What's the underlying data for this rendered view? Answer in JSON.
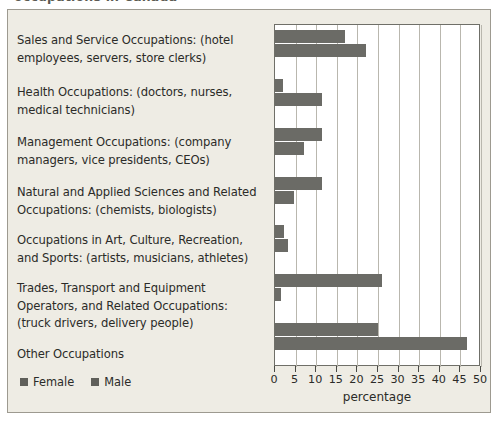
{
  "top_sliver": {
    "text": "occupations in Canada"
  },
  "legend": {
    "position": "bottom-left",
    "entries": [
      {
        "label": "Female",
        "color": "#5f5f5a"
      },
      {
        "label": "Male",
        "color": "#5f5f5a"
      }
    ]
  },
  "axis": {
    "title": "percentage",
    "ticks": [
      "0",
      "5",
      "10",
      "15",
      "20",
      "25",
      "30",
      "35",
      "40",
      "45",
      "50"
    ]
  },
  "chart_data": {
    "type": "bar",
    "orientation": "horizontal",
    "title": "",
    "subtitle": "",
    "xlabel": "percentage",
    "ylabel": "",
    "xlim": [
      0,
      50
    ],
    "xticks": [
      0,
      5,
      10,
      15,
      20,
      25,
      30,
      35,
      40,
      45,
      50
    ],
    "grid": true,
    "grid_axis": "x",
    "legend_position": "bottom-left",
    "categories": [
      "Sales and Service Occupations: (hotel employees, servers, store clerks)",
      "Health Occupations: (doctors, nurses, medical technicians)",
      "Management Occupations: (company managers, vice presidents, CEOs)",
      "Natural and Applied Sciences and Related Occupations: (chemists, biologists)",
      "Occupations in Art, Culture, Recreation, and Sports: (artists, musicians, athletes)",
      "Trades, Transport and Equipment Operators, and Related Occupations: (truck drivers, delivery people)",
      "Other Occupations"
    ],
    "series": [
      {
        "name": "Female",
        "color": "#6b6b66",
        "values": [
          17,
          2,
          11.5,
          11.5,
          2.2,
          26,
          25
        ]
      },
      {
        "name": "Male",
        "color": "#6b6b66",
        "values": [
          22,
          11.5,
          7,
          4.5,
          3.2,
          1.5,
          46.5
        ]
      }
    ]
  }
}
